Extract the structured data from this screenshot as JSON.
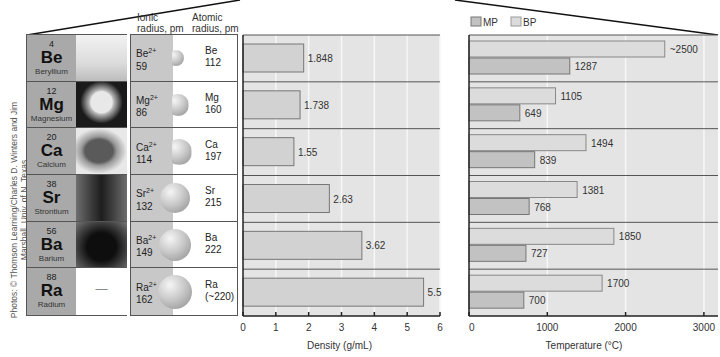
{
  "credit": "Photos: © Thomson Learning/Charles D. Winters and Jim Marshall, Univ. of N. Texas",
  "headers": {
    "ionic_radius": "Ionic radius, pm",
    "ionic_radius_line1": "Ionic",
    "ionic_radius_line2": "radius, pm",
    "atomic_radius_line1": "Atomic",
    "atomic_radius_line2": "radius, pm"
  },
  "elements": [
    {
      "number": "4",
      "symbol": "Be",
      "name": "Beryllium",
      "ion": "Be",
      "charge": "2+",
      "ionic_radius": "59",
      "atom": "Be",
      "atomic_radius": "112",
      "photo": "beryllium-photo"
    },
    {
      "number": "12",
      "symbol": "Mg",
      "name": "Magnesium",
      "ion": "Mg",
      "charge": "2+",
      "ionic_radius": "86",
      "atom": "Mg",
      "atomic_radius": "160",
      "photo": "magnesium-photo"
    },
    {
      "number": "20",
      "symbol": "Ca",
      "name": "Calcium",
      "ion": "Ca",
      "charge": "2+",
      "ionic_radius": "114",
      "atom": "Ca",
      "atomic_radius": "197",
      "photo": "calcium-photo"
    },
    {
      "number": "38",
      "symbol": "Sr",
      "name": "Strontium",
      "ion": "Sr",
      "charge": "2+",
      "ionic_radius": "132",
      "atom": "Sr",
      "atomic_radius": "215",
      "photo": "strontium-photo"
    },
    {
      "number": "56",
      "symbol": "Ba",
      "name": "Barium",
      "ion": "Ba",
      "charge": "2+",
      "ionic_radius": "149",
      "atom": "Ba",
      "atomic_radius": "222",
      "photo": "barium-photo"
    },
    {
      "number": "88",
      "symbol": "Ra",
      "name": "Radium",
      "ion": "Ra",
      "charge": "2+",
      "ionic_radius": "162",
      "atom": "Ra",
      "atomic_radius": "(~220)",
      "photo": "—"
    }
  ],
  "colors": {
    "symbol_cell": "#a9a9a9",
    "panel_bg": "#e4e4e4",
    "bp_bar": "#dcdcdc",
    "mp_bar": "#c2c2c2",
    "density_bar": "#d2d2d2",
    "grid": "#f7f7f7",
    "divider": "#555555"
  },
  "chart_data": [
    {
      "type": "bar",
      "orientation": "horizontal",
      "title": "",
      "categories": [
        "Be",
        "Mg",
        "Ca",
        "Sr",
        "Ba",
        "Ra"
      ],
      "values": [
        1.848,
        1.738,
        1.55,
        2.63,
        3.62,
        5.5
      ],
      "value_labels": [
        "1.848",
        "1.738",
        "1.55",
        "2.63",
        "3.62",
        "5.5"
      ],
      "xlabel": "Density (g/mL)",
      "ylabel": "",
      "xlim": [
        0,
        6
      ],
      "xticks": [
        "0",
        "1",
        "2",
        "3",
        "4",
        "5",
        "6"
      ],
      "grid": true
    },
    {
      "type": "bar",
      "orientation": "horizontal",
      "title": "",
      "categories": [
        "Be",
        "Mg",
        "Ca",
        "Sr",
        "Ba",
        "Ra"
      ],
      "series": [
        {
          "name": "BP",
          "values": [
            2500,
            1105,
            1494,
            1381,
            1850,
            1700
          ],
          "value_labels": [
            "~2500",
            "1105",
            "1494",
            "1381",
            "1850",
            "1700"
          ]
        },
        {
          "name": "MP",
          "values": [
            1287,
            649,
            839,
            768,
            727,
            700
          ],
          "value_labels": [
            "1287",
            "649",
            "839",
            "768",
            "727",
            "700"
          ]
        }
      ],
      "legend": [
        "MP",
        "BP"
      ],
      "legend_position": "top-left",
      "xlabel": "Temperature (°C)",
      "ylabel": "",
      "xlim": [
        0,
        3100
      ],
      "xticks": [
        "0",
        "1000",
        "2000",
        "3000"
      ],
      "grid": true
    }
  ]
}
